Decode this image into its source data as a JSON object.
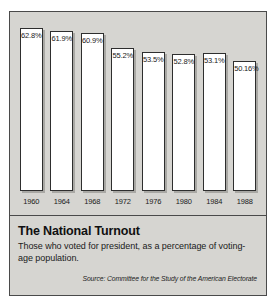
{
  "chart_data": {
    "type": "bar",
    "title": "The National Turnout",
    "subtitle": "Those who voted for president, as a percentage of voting-age population.",
    "source": "Source: Committee for the Study of the American Electorate",
    "xlabel": "",
    "ylabel": "",
    "ylim": [
      0,
      66
    ],
    "grid": false,
    "legend": "none",
    "categories": [
      "1960",
      "1964",
      "1968",
      "1972",
      "1976",
      "1980",
      "1984",
      "1988"
    ],
    "values": [
      62.8,
      61.9,
      60.9,
      55.2,
      53.5,
      52.8,
      53.1,
      50.16
    ],
    "value_labels": [
      "62.8%",
      "61.9%",
      "60.9%",
      "55.2%",
      "53.5%",
      "52.8%",
      "53.1%",
      "50.16%"
    ]
  },
  "style": {
    "panel_background": "#d6d5d1",
    "bar_fill": "#ffffff",
    "bar_outline": "#2e2e2e",
    "bar_shadow": "#a9a8a4",
    "frame_border": "#4a4a4a",
    "text_color": "#1a1a1a"
  }
}
